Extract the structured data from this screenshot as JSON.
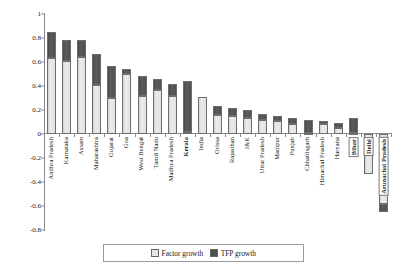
{
  "chart_data": {
    "type": "bar",
    "title": "",
    "subtitle": "",
    "xlabel": "",
    "ylabel": "",
    "stacked": true,
    "grid": false,
    "legend_position": "bottom",
    "ylim": [
      -0.8,
      1.0
    ],
    "yticks": [
      1,
      0.8,
      0.6,
      0.4,
      0.2,
      0,
      -0.2,
      -0.4,
      -0.6,
      -0.8
    ],
    "ytick_labels": [
      "1",
      "0.8",
      "0.6",
      "0.4",
      "0.2",
      "0",
      "-0.2",
      "-0.4",
      "-0.6",
      "-0.8"
    ],
    "categories": [
      "Andhra Pradesh",
      "Karnataka",
      "Assam",
      "Maharashtra",
      "Gujarat",
      "Goa",
      "West Bengal",
      "Tamil Nadu",
      "Madhya Pradesh",
      "Kerala",
      "India",
      "Orissa",
      "Rajasthan",
      "J&K",
      "Uttar Pradesh",
      "Manipur",
      "Punjab",
      "Chhattisgarh",
      "Himachal Pradesh",
      "Haryana",
      "Bihar",
      "Delhi",
      "Arunachal Pradesh"
    ],
    "category_styles": [
      "normal",
      "normal",
      "normal",
      "normal",
      "normal",
      "normal",
      "normal",
      "normal",
      "normal",
      "bold",
      "normal",
      "normal",
      "normal",
      "normal",
      "normal",
      "normal",
      "normal",
      "normal",
      "normal",
      "normal",
      "boxed",
      "boxed",
      "boxed"
    ],
    "series": [
      {
        "name": "Factor growth",
        "color": "#e6e6e6",
        "values": [
          0.63,
          0.61,
          0.64,
          0.41,
          0.3,
          0.5,
          0.32,
          0.37,
          0.32,
          0.02,
          0.31,
          0.16,
          0.15,
          0.13,
          0.12,
          0.11,
          0.08,
          0.01,
          0.08,
          0.05,
          0.01,
          -0.33,
          -0.58
        ]
      },
      {
        "name": "TFP growth",
        "color": "#4f4f4f",
        "values": [
          0.22,
          0.17,
          0.14,
          0.26,
          0.27,
          0.04,
          0.16,
          0.09,
          0.1,
          0.42,
          0.0,
          0.07,
          0.07,
          0.07,
          0.05,
          0.04,
          0.05,
          0.11,
          0.03,
          0.04,
          0.12,
          0.0,
          -0.07
        ]
      }
    ],
    "totals": [
      0.85,
      0.78,
      0.78,
      0.67,
      0.57,
      0.54,
      0.48,
      0.46,
      0.42,
      0.44,
      0.31,
      0.23,
      0.22,
      0.2,
      0.17,
      0.15,
      0.13,
      0.12,
      0.11,
      0.09,
      0.13,
      -0.33,
      -0.65
    ]
  },
  "legend": {
    "items": [
      {
        "label": "Factor growth",
        "swatch": "factor-swatch-icon"
      },
      {
        "label": "TFP growth",
        "swatch": "tfp-swatch-icon"
      }
    ]
  }
}
